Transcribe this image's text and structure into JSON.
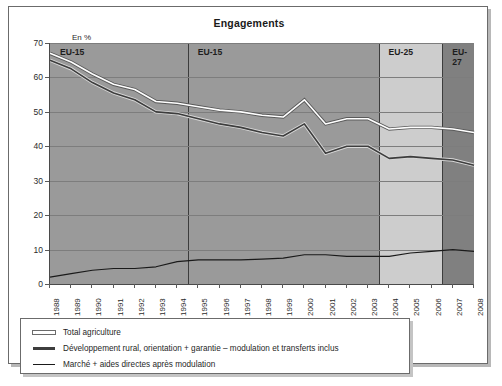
{
  "chart_data": {
    "type": "line",
    "title": "Engagements",
    "ylabel": "En %",
    "xlabel": "",
    "ylim": [
      0,
      70
    ],
    "yticks": [
      0,
      10,
      20,
      30,
      40,
      50,
      60,
      70
    ],
    "grid": true,
    "legend_position": "below",
    "categories": [
      "1988",
      "1989",
      "1990",
      "1991",
      "1992",
      "1993",
      "1994",
      "1995",
      "1996",
      "1997",
      "1998",
      "1999",
      "2000",
      "2001",
      "2002",
      "2003",
      "2004",
      "2005",
      "2006",
      "2007",
      "2008"
    ],
    "series": [
      {
        "name": "Total agriculture",
        "color": "#ffffff",
        "values": [
          67.0,
          64.5,
          61.0,
          58.0,
          56.5,
          53.0,
          52.5,
          51.5,
          50.5,
          50.0,
          49.0,
          48.5,
          53.5,
          46.5,
          48.0,
          48.0,
          45.0,
          45.5,
          45.5,
          45.0,
          44.0
        ]
      },
      {
        "name": "Développement rural, orientation + garantie – modulation et transferts inclus",
        "color": "#3d3d3d",
        "values": [
          65.0,
          62.5,
          58.5,
          55.5,
          53.5,
          50.0,
          49.5,
          48.0,
          46.5,
          45.5,
          44.0,
          43.0,
          46.5,
          38.0,
          40.0,
          40.0,
          36.5,
          37.0,
          36.5,
          36.0,
          34.5
        ]
      },
      {
        "name": "Marché + aides directes après modulation",
        "color": "#1a1a1a",
        "values": [
          2.0,
          3.0,
          4.0,
          4.5,
          4.5,
          5.0,
          6.5,
          7.0,
          7.0,
          7.0,
          7.2,
          7.5,
          8.5,
          8.5,
          8.0,
          8.0,
          8.0,
          9.0,
          9.5,
          10.0,
          9.5
        ]
      }
    ],
    "bands": [
      {
        "label": "EU-15",
        "start": "1988",
        "end": "1994",
        "color": "#9a9a9a"
      },
      {
        "label": "EU-15",
        "start": "1995",
        "end": "2003",
        "color": "#9a9a9a"
      },
      {
        "label": "EU-25",
        "start": "2004",
        "end": "2006",
        "color": "#cdcdcd"
      },
      {
        "label": "EU-27",
        "start": "2007",
        "end": "2008",
        "color": "#808080"
      }
    ],
    "legend": [
      {
        "label": "Total agriculture",
        "color": "#ffffff"
      },
      {
        "label": "Développement rural, orientation + garantie – modulation et transferts inclus",
        "color": "#3d3d3d"
      },
      {
        "label": "Marché + aides directes après modulation",
        "color": "#1a1a1a"
      }
    ]
  }
}
